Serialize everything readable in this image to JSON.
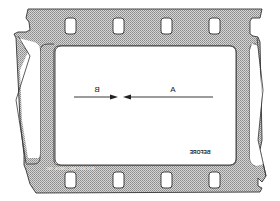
{
  "diagram": {
    "labels": {
      "arrow_a": "A",
      "arrow_b": "B",
      "frame_caption": "BEFORE",
      "edge_print": "ROCKET RECORDS, INC"
    },
    "mirrored_text": true,
    "colors": {
      "outline": "#333333",
      "film_fill": "#bdbdbd",
      "background": "#ffffff"
    }
  }
}
